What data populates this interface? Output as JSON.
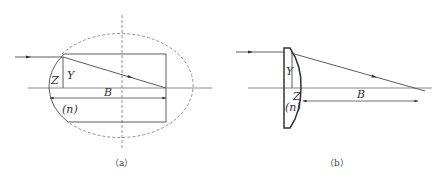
{
  "figure_a": {
    "caption": "（a）",
    "labels": {
      "Z": "Z",
      "Y": "Y",
      "B": "B",
      "n": "(n)"
    },
    "description": "Ellipsoidal refracting surface with inscribed cylindrical lens; incident parallel ray refracts to focal point on axis"
  },
  "figure_b": {
    "caption": "（b）",
    "labels": {
      "Y": "Y",
      "Z": "Z",
      "n": "(n)",
      "B": "B"
    },
    "description": "Plano-convex aspheric lens; incident parallel ray converges to focal point at distance B"
  },
  "colors": {
    "line": "#4a4a4a",
    "thin_line": "#6a6a6a",
    "dashed": "#777777"
  }
}
